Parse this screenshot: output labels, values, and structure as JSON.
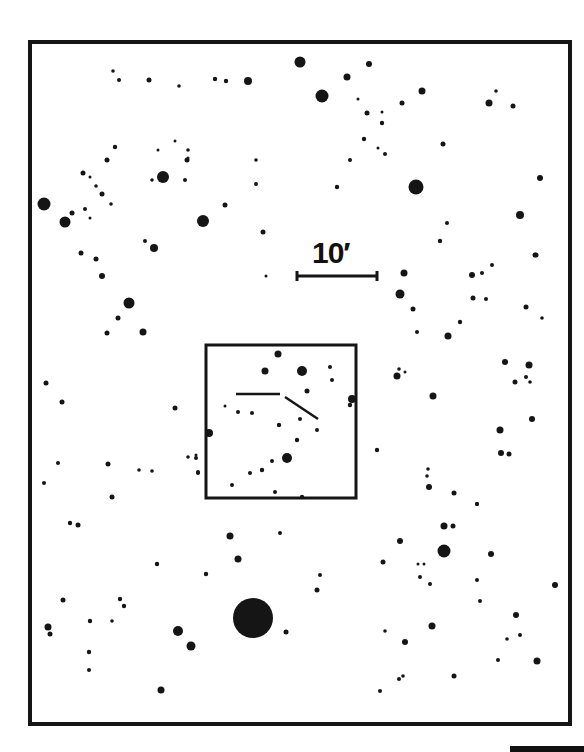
{
  "chart": {
    "type": "finder-chart",
    "frame": {
      "x": 30,
      "y": 42,
      "w": 540,
      "h": 682,
      "stroke": 4
    },
    "inset": {
      "x": 206,
      "y": 345,
      "w": 150,
      "h": 153,
      "stroke": 3
    },
    "scale_bar": {
      "label": "10′",
      "x1": 297,
      "x2": 377,
      "y": 276,
      "label_x": 312,
      "label_y": 236
    },
    "marker_lines": [
      {
        "x1": 236,
        "y1": 394,
        "x2": 280,
        "y2": 394
      },
      {
        "x1": 285,
        "y1": 397,
        "x2": 318,
        "y2": 419
      }
    ],
    "bottom_bar": true,
    "stars": [
      [
        113,
        71,
        1.8
      ],
      [
        119,
        80,
        2
      ],
      [
        149,
        80,
        2.5
      ],
      [
        179,
        86,
        1.8
      ],
      [
        215,
        79,
        2.2
      ],
      [
        226,
        81,
        2.2
      ],
      [
        248,
        81,
        4
      ],
      [
        300,
        62,
        5.5
      ],
      [
        322,
        96,
        6.5
      ],
      [
        347,
        77,
        3.5
      ],
      [
        369,
        64,
        3
      ],
      [
        358,
        99,
        1.5
      ],
      [
        367,
        113,
        2.5
      ],
      [
        382,
        112,
        1.5
      ],
      [
        382,
        123,
        2.2
      ],
      [
        364,
        139,
        2.2
      ],
      [
        378,
        148,
        1.5
      ],
      [
        385,
        154,
        2
      ],
      [
        350,
        160,
        2
      ],
      [
        337,
        187,
        2.2
      ],
      [
        416,
        187,
        7.5
      ],
      [
        422,
        91,
        3.5
      ],
      [
        402,
        103,
        2.5
      ],
      [
        443,
        144,
        2.5
      ],
      [
        489,
        103,
        3.5
      ],
      [
        496,
        91,
        1.8
      ],
      [
        513,
        106,
        2.5
      ],
      [
        540,
        178,
        3
      ],
      [
        520,
        215,
        4
      ],
      [
        535,
        255,
        2.5
      ],
      [
        44,
        204,
        6.5
      ],
      [
        65,
        222,
        5.5
      ],
      [
        72,
        213,
        2.5
      ],
      [
        83,
        173,
        2.5
      ],
      [
        90,
        177,
        1.5
      ],
      [
        96,
        186,
        1.8
      ],
      [
        102,
        194,
        2.5
      ],
      [
        111,
        204,
        1.8
      ],
      [
        85,
        209,
        2
      ],
      [
        90,
        218,
        1.5
      ],
      [
        115,
        147,
        2.2
      ],
      [
        107,
        160,
        2.5
      ],
      [
        81,
        253,
        2.5
      ],
      [
        96,
        259,
        2.5
      ],
      [
        102,
        276,
        3
      ],
      [
        158,
        150,
        1.5
      ],
      [
        163,
        177,
        6
      ],
      [
        175,
        141,
        1.5
      ],
      [
        188,
        150,
        1.8
      ],
      [
        188,
        158,
        1.5
      ],
      [
        187,
        160,
        2.5
      ],
      [
        152,
        180,
        1.8
      ],
      [
        185,
        180,
        2
      ],
      [
        203,
        221,
        6
      ],
      [
        225,
        205,
        2.5
      ],
      [
        256,
        160,
        1.8
      ],
      [
        256,
        184,
        2
      ],
      [
        263,
        232,
        2.5
      ],
      [
        145,
        241,
        2
      ],
      [
        154,
        248,
        4
      ],
      [
        129,
        303,
        5.5
      ],
      [
        118,
        318,
        2.5
      ],
      [
        107,
        333,
        2.5
      ],
      [
        143,
        332,
        3.5
      ],
      [
        266,
        276,
        1.5
      ],
      [
        404,
        273,
        3.5
      ],
      [
        400,
        294,
        4.5
      ],
      [
        413,
        309,
        2.5
      ],
      [
        417,
        332,
        2
      ],
      [
        448,
        336,
        3.5
      ],
      [
        460,
        322,
        2.2
      ],
      [
        472,
        275,
        3
      ],
      [
        482,
        273,
        2
      ],
      [
        492,
        265,
        2
      ],
      [
        536,
        255,
        2.5
      ],
      [
        473,
        298,
        2.5
      ],
      [
        486,
        299,
        2
      ],
      [
        526,
        307,
        2.5
      ],
      [
        542,
        318,
        1.8
      ],
      [
        440,
        241,
        2.2
      ],
      [
        447,
        223,
        2
      ],
      [
        46,
        383,
        2.5
      ],
      [
        62,
        402,
        2.5
      ],
      [
        58,
        463,
        2
      ],
      [
        44,
        483,
        2
      ],
      [
        108,
        464,
        2.5
      ],
      [
        139,
        470,
        1.8
      ],
      [
        152,
        471,
        1.8
      ],
      [
        175,
        408,
        2.5
      ],
      [
        188,
        457,
        1.8
      ],
      [
        196,
        455,
        1.5
      ],
      [
        198,
        473,
        2
      ],
      [
        112,
        497,
        2.5
      ],
      [
        278,
        354,
        3.5
      ],
      [
        265,
        371,
        3.5
      ],
      [
        302,
        371,
        5
      ],
      [
        330,
        367,
        2
      ],
      [
        332,
        380,
        2
      ],
      [
        307,
        391,
        2.5
      ],
      [
        225,
        406,
        1.5
      ],
      [
        238,
        412,
        2
      ],
      [
        252,
        413,
        2
      ],
      [
        279,
        425,
        2.2
      ],
      [
        300,
        419,
        2
      ],
      [
        317,
        430,
        2
      ],
      [
        297,
        440,
        2.2
      ],
      [
        287,
        458,
        5
      ],
      [
        272,
        461,
        2
      ],
      [
        262,
        470,
        2.2
      ],
      [
        250,
        473,
        2
      ],
      [
        232,
        485,
        2
      ],
      [
        275,
        492,
        2
      ],
      [
        302,
        497,
        2.2
      ],
      [
        352,
        399,
        4
      ],
      [
        350,
        405,
        2.2
      ],
      [
        209,
        433,
        4
      ],
      [
        196,
        458,
        2
      ],
      [
        198,
        472,
        2
      ],
      [
        399,
        369,
        1.8
      ],
      [
        405,
        372,
        1.5
      ],
      [
        397,
        376,
        3.5
      ],
      [
        433,
        396,
        3.5
      ],
      [
        505,
        362,
        3
      ],
      [
        529,
        365,
        3.5
      ],
      [
        526,
        377,
        2
      ],
      [
        515,
        382,
        2.5
      ],
      [
        530,
        382,
        1.8
      ],
      [
        532,
        419,
        3
      ],
      [
        500,
        430,
        3.5
      ],
      [
        501,
        453,
        3
      ],
      [
        509,
        454,
        2.5
      ],
      [
        377,
        450,
        2.2
      ],
      [
        428,
        469,
        1.8
      ],
      [
        427,
        476,
        1.8
      ],
      [
        429,
        487,
        3
      ],
      [
        454,
        493,
        2.5
      ],
      [
        477,
        504,
        2
      ],
      [
        70,
        523,
        2.2
      ],
      [
        78,
        525,
        2.5
      ],
      [
        157,
        564,
        2.2
      ],
      [
        206,
        574,
        2.2
      ],
      [
        230,
        536,
        3.5
      ],
      [
        238,
        559,
        3.5
      ],
      [
        280,
        533,
        2
      ],
      [
        320,
        575,
        2
      ],
      [
        317,
        590,
        2.5
      ],
      [
        63,
        600,
        2.5
      ],
      [
        120,
        599,
        2.2
      ],
      [
        124,
        606,
        2.2
      ],
      [
        90,
        621,
        2.2
      ],
      [
        112,
        621,
        1.8
      ],
      [
        48,
        627,
        3.5
      ],
      [
        50,
        634,
        2.5
      ],
      [
        89,
        652,
        2.2
      ],
      [
        89,
        670,
        2
      ],
      [
        178,
        631,
        5
      ],
      [
        191,
        646,
        4.5
      ],
      [
        253,
        618,
        20
      ],
      [
        286,
        632,
        2.5
      ],
      [
        161,
        690,
        3.5
      ],
      [
        444,
        526,
        3.5
      ],
      [
        453,
        526,
        2.5
      ],
      [
        477,
        504,
        2
      ],
      [
        400,
        541,
        3
      ],
      [
        383,
        562,
        2.5
      ],
      [
        418,
        564,
        1.5
      ],
      [
        424,
        564,
        1.5
      ],
      [
        420,
        577,
        2
      ],
      [
        430,
        584,
        2
      ],
      [
        444,
        551,
        6.5
      ],
      [
        491,
        554,
        3
      ],
      [
        477,
        580,
        2
      ],
      [
        480,
        601,
        2
      ],
      [
        555,
        585,
        3
      ],
      [
        516,
        615,
        3
      ],
      [
        520,
        635,
        2
      ],
      [
        507,
        639,
        1.8
      ],
      [
        498,
        660,
        2
      ],
      [
        537,
        661,
        3.5
      ],
      [
        432,
        626,
        3.5
      ],
      [
        385,
        631,
        1.8
      ],
      [
        405,
        642,
        3
      ],
      [
        380,
        691,
        2
      ],
      [
        399,
        679,
        2
      ],
      [
        403,
        676,
        1.8
      ],
      [
        454,
        676,
        2.5
      ]
    ]
  }
}
